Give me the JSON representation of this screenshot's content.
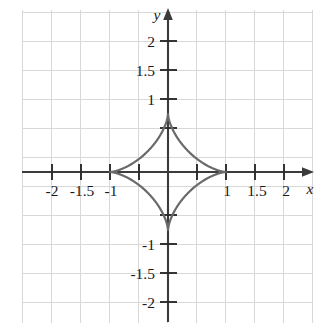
{
  "figure": {
    "margin_text": "n",
    "background_color": "#ffffff",
    "grid_color": "#d8d8d8",
    "axis_color": "#3b3b3b",
    "curve_color": "#6a6a6a",
    "label_color": "#1a1a1a"
  },
  "axes": {
    "x_axis_label": "x",
    "y_axis_label": "y",
    "x_tick_labels": [
      "-2",
      "-1.5",
      "-1",
      "1",
      "1.5",
      "2"
    ],
    "y_tick_labels": [
      "2",
      "1.5",
      "1",
      "-1",
      "-1.5",
      "-2"
    ]
  },
  "chart_data": {
    "type": "line",
    "title": "",
    "subtitle": "",
    "xlabel": "x",
    "ylabel": "y",
    "xlim": [
      -2.55,
      2.55
    ],
    "ylim": [
      -2.6,
      2.5
    ],
    "grid": true,
    "grid_step": 0.5,
    "legend": "none",
    "x_ticks": [
      -2.5,
      -2,
      -1.5,
      -1,
      -0.5,
      0.5,
      1,
      1.5,
      2,
      2.5
    ],
    "x_tick_labels_map": {
      "-2": "-2",
      "-1.5": "-1.5",
      "-1": "-1",
      "1": "1",
      "1.5": "1.5",
      "2": "2"
    },
    "y_ticks": [
      -2,
      -1.5,
      -1,
      -0.5,
      0.5,
      1,
      1.5,
      2
    ],
    "y_tick_labels_map": {
      "2": "2",
      "1.5": "1.5",
      "1": "1",
      "-1": "-1",
      "-1.5": "-1.5",
      "-2": "-2"
    },
    "curve_equation": "x^(2/3) + y^(2/3) = 1",
    "curve_name": "astroid",
    "parametric": {
      "x": "cos(t)^3",
      "y": "sin(t)^3",
      "t_range": [
        0,
        6.283185307179586
      ]
    },
    "cusp_points": [
      {
        "x": 1,
        "y": 0
      },
      {
        "x": 0,
        "y": 1
      },
      {
        "x": -1,
        "y": 0
      },
      {
        "x": 0,
        "y": -1
      }
    ],
    "series": [
      {
        "name": "astroid",
        "closed": true,
        "points": [
          {
            "x": 1.0,
            "y": 0.0
          },
          {
            "x": 0.9729,
            "y": 0.0014
          },
          {
            "x": 0.8932,
            "y": 0.0109
          },
          {
            "x": 0.7684,
            "y": 0.0354
          },
          {
            "x": 0.6128,
            "y": 0.0801
          },
          {
            "x": 0.4453,
            "y": 0.1469
          },
          {
            "x": 0.2865,
            "y": 0.2332
          },
          {
            "x": 0.1545,
            "y": 0.3314
          },
          {
            "x": 0.0593,
            "y": 0.4304
          },
          {
            "x": 0.0074,
            "y": 0.5177
          },
          {
            "x": 0.0,
            "y": 0.5774
          },
          {
            "x": 0.0074,
            "y": 0.6427
          },
          {
            "x": 0.0593,
            "y": 0.7432
          },
          {
            "x": 0.1545,
            "y": 0.8321
          },
          {
            "x": 0.2865,
            "y": 0.9045
          },
          {
            "x": 0.4453,
            "y": 0.9561
          },
          {
            "x": 0.6128,
            "y": 0.9848
          },
          {
            "x": 0.7684,
            "y": 0.9975
          },
          {
            "x": 0.8932,
            "y": 0.9999
          },
          {
            "x": 0.0,
            "y": 1.0
          },
          {
            "x": -1.0,
            "y": 0.0
          },
          {
            "x": 0.0,
            "y": -1.0
          }
        ]
      }
    ]
  }
}
